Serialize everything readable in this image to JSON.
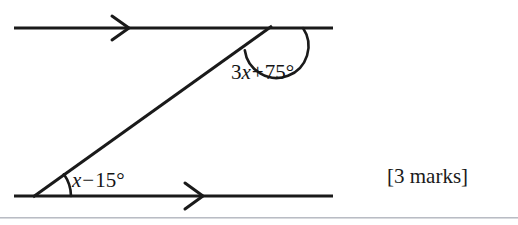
{
  "figure": {
    "name": "parallel-lines-transversal-angles",
    "stroke_color": "#1a1a1a",
    "background_color": "#ffffff",
    "top_line": {
      "label": "top-parallel-line",
      "x1": 14,
      "y1": 28,
      "x2": 333,
      "y2": 28,
      "arrow_marker": {
        "name": "chevron-arrow-marker",
        "tip_x": 128,
        "tip_y": 28,
        "direction": "right"
      }
    },
    "bottom_line": {
      "label": "bottom-parallel-line",
      "x1": 14,
      "y1": 196,
      "x2": 333,
      "y2": 196,
      "arrow_marker": {
        "name": "chevron-arrow-marker",
        "tip_x": 202,
        "tip_y": 196,
        "direction": "right"
      }
    },
    "transversal": {
      "label": "transversal-line",
      "x1": 33,
      "y1": 196,
      "x2": 271,
      "y2": 27
    },
    "top_vertex": {
      "x": 271,
      "y": 28
    },
    "bottom_vertex": {
      "x": 33,
      "y": 196
    },
    "top_arc": {
      "name": "obtuse-angle-arc",
      "radius": 32,
      "start_angle_deg": 180,
      "end_angle_deg": 35
    },
    "bottom_arc": {
      "name": "acute-angle-arc",
      "radius": 38,
      "start_angle_deg": 0,
      "end_angle_deg": 35
    }
  },
  "labels": {
    "top_angle": {
      "coefficient": "3",
      "variable": "x",
      "operator": "+",
      "constant": "75°",
      "full_text": "3x + 75°"
    },
    "bottom_angle": {
      "coefficient": "",
      "variable": "x",
      "operator": "−",
      "constant": "15°",
      "full_text": "x − 15°"
    }
  },
  "marks": {
    "text": "[3 marks]",
    "count": "3"
  },
  "rule": {
    "color": "#b9bcc4"
  }
}
